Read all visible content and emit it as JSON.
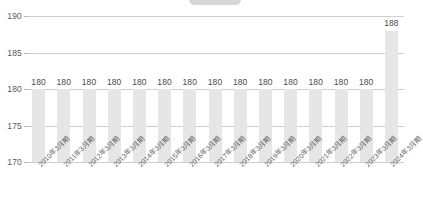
{
  "chart_data": {
    "type": "bar",
    "title": "",
    "subtitle": "",
    "xlabel": "",
    "ylabel": "",
    "ylim": [
      170,
      190
    ],
    "yticks": [
      170,
      175,
      180,
      185,
      190
    ],
    "grid": true,
    "legend_position": "none",
    "categories": [
      "2010年3月期",
      "2011年3月期",
      "2012年3月期",
      "2013年3月期",
      "2014年3月期",
      "2015年3月期",
      "2016年3月期",
      "2017年3月期",
      "2018年3月期",
      "2019年3月期",
      "2020年3月期",
      "2021年3月期",
      "2022年3月期",
      "2023年3月期",
      "2024年3月期"
    ],
    "values": [
      180,
      180,
      180,
      180,
      180,
      180,
      180,
      180,
      180,
      180,
      180,
      180,
      180,
      180,
      188
    ],
    "data_labels": [
      "180",
      "180",
      "180",
      "180",
      "180",
      "180",
      "180",
      "180",
      "180",
      "180",
      "180",
      "180",
      "180",
      "180",
      "188"
    ],
    "colors": {
      "bar": "#e6e6e6",
      "gridline": "#cfcfcf",
      "tick_text": "#5a5a5a",
      "label_text": "#4a4a4a",
      "axis_text": "#5f5f5f",
      "background": "#ffffff",
      "top_pill": "#c9c9c9"
    }
  }
}
